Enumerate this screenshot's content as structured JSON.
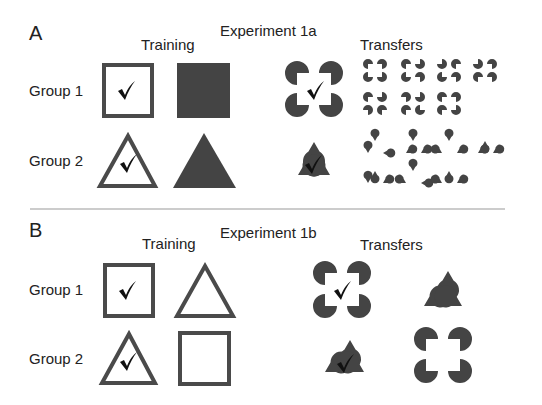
{
  "colors": {
    "shape": "#444444",
    "check": "#111111",
    "divider": "#888888",
    "text": "#222222"
  },
  "panels": [
    {
      "letter": "A",
      "title": "Experiment 1a",
      "training_header": "Training",
      "transfers_header": "Transfers",
      "groups": [
        {
          "label": "Group 1",
          "trained_positive": "outlined square (checked)",
          "trained_negative": "filled square",
          "transfer_positive": "illusory Kanizsa square (checked)",
          "transfer_alternatives": "7 scrambled inducer configurations"
        },
        {
          "label": "Group 2",
          "trained_positive": "outlined triangle (checked)",
          "trained_negative": "filled triangle",
          "transfer_positive": "illusory Kanizsa triangle (checked)",
          "transfer_alternatives": "7 scrambled inducer configurations"
        }
      ]
    },
    {
      "letter": "B",
      "title": "Experiment 1b",
      "training_header": "Training",
      "transfers_header": "Transfers",
      "groups": [
        {
          "label": "Group 1",
          "trained_positive": "outlined square (checked)",
          "trained_negative": "outlined triangle",
          "transfer_positive": "illusory Kanizsa square (checked)",
          "transfer_negative": "illusory Kanizsa triangle"
        },
        {
          "label": "Group 2",
          "trained_positive": "outlined triangle (checked)",
          "trained_negative": "outlined square",
          "transfer_positive": "illusory Kanizsa triangle (checked)",
          "transfer_negative": "illusory Kanizsa square"
        }
      ]
    }
  ],
  "check_glyph": "✓"
}
